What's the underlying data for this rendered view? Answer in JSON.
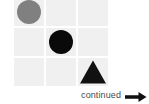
{
  "canvas": {
    "width": 149,
    "height": 104,
    "background": "#ffffff"
  },
  "matrix": {
    "name": "shape-matrix",
    "rows": 3,
    "columns": 3,
    "cell_background": "#f0f0f0",
    "cells": [
      {
        "row": 0,
        "col": 0,
        "shape": "circle",
        "color": "#808080",
        "label": "gray-circle"
      },
      {
        "row": 0,
        "col": 1,
        "shape": "empty",
        "color": "",
        "label": "empty-cell"
      },
      {
        "row": 0,
        "col": 2,
        "shape": "empty",
        "color": "",
        "label": "empty-cell"
      },
      {
        "row": 1,
        "col": 0,
        "shape": "empty",
        "color": "",
        "label": "empty-cell"
      },
      {
        "row": 1,
        "col": 1,
        "shape": "circle",
        "color": "#0a0a0a",
        "label": "black-circle"
      },
      {
        "row": 1,
        "col": 2,
        "shape": "empty",
        "color": "",
        "label": "empty-cell"
      },
      {
        "row": 2,
        "col": 0,
        "shape": "empty",
        "color": "",
        "label": "empty-cell"
      },
      {
        "row": 2,
        "col": 1,
        "shape": "empty",
        "color": "",
        "label": "empty-cell"
      },
      {
        "row": 2,
        "col": 2,
        "shape": "triangle",
        "color": "#111111",
        "label": "black-triangle"
      }
    ]
  },
  "footer": {
    "continued_label": "continued",
    "arrow_icon": "arrow-right-icon",
    "arrow_color": "#111111"
  }
}
